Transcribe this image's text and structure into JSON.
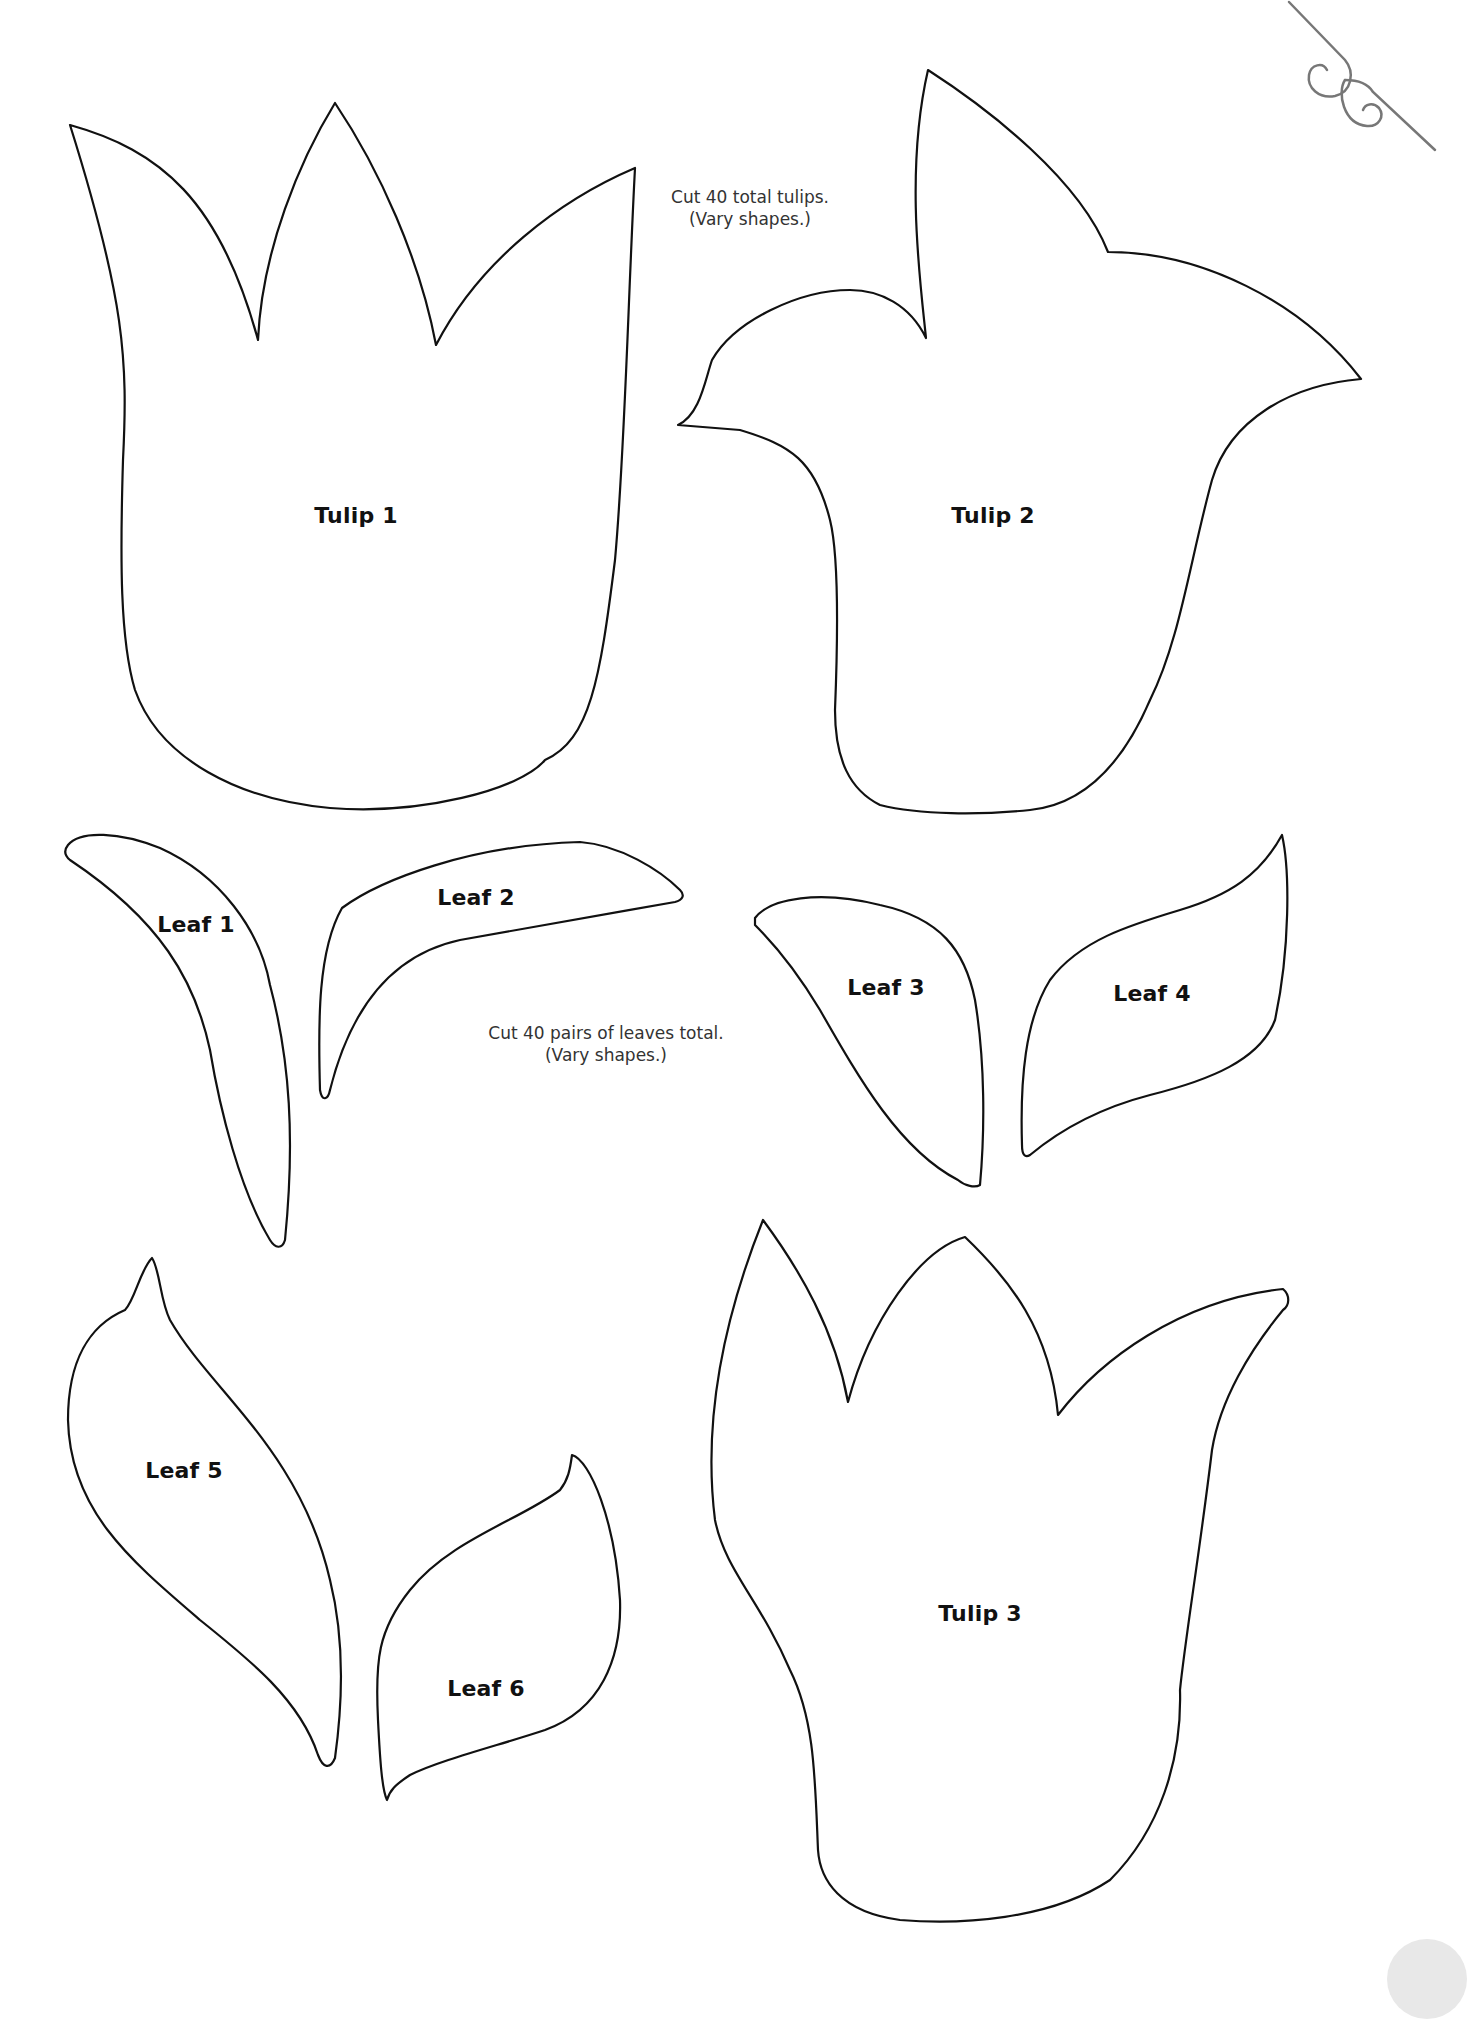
{
  "notes": {
    "tulips": {
      "line1": "Cut 40 total tulips.",
      "line2": "(Vary shapes.)"
    },
    "leaves": {
      "line1": "Cut 40 pairs of leaves total.",
      "line2": "(Vary shapes.)"
    }
  },
  "shapes": {
    "tulip1": {
      "label": "Tulip 1"
    },
    "tulip2": {
      "label": "Tulip 2"
    },
    "tulip3": {
      "label": "Tulip 3"
    },
    "leaf1": {
      "label": "Leaf 1"
    },
    "leaf2": {
      "label": "Leaf 2"
    },
    "leaf3": {
      "label": "Leaf 3"
    },
    "leaf4": {
      "label": "Leaf 4"
    },
    "leaf5": {
      "label": "Leaf 5"
    },
    "leaf6": {
      "label": "Leaf 6"
    }
  },
  "decorations": {
    "flourish_icon": "scroll-flourish",
    "page_corner": "page-number-circle"
  },
  "colors": {
    "outline": "#111111",
    "note_text": "#333333",
    "flourish": "#777777",
    "background": "#ffffff"
  }
}
